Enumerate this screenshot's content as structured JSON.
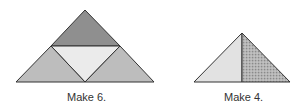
{
  "figures": [
    {
      "caption": "Make 6.",
      "pieces": [
        {
          "name": "top-triangle",
          "fill": "#8f8f8f"
        },
        {
          "name": "center-inverted-triangle",
          "fill": "#ebebeb"
        },
        {
          "name": "left-triangle",
          "fill": "#bdbdbd"
        },
        {
          "name": "right-triangle",
          "fill": "#bdbdbd"
        }
      ]
    },
    {
      "caption": "Make 4.",
      "pieces": [
        {
          "name": "left-half-triangle",
          "fill": "#e2e2e2"
        },
        {
          "name": "right-half-triangle-dotted",
          "fill": "#a8a8a8"
        }
      ]
    }
  ],
  "stroke_color": "#333333"
}
